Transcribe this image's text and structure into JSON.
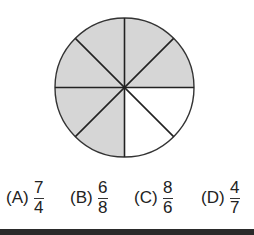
{
  "figure": {
    "type": "circle-fraction",
    "total_slices": 8,
    "shaded_slices": 6,
    "shaded_color": "#d6d6d6",
    "unshaded_color": "#ffffff",
    "line_color": "#333333"
  },
  "options": [
    {
      "label": "(A)",
      "numerator": "7",
      "denominator": "4"
    },
    {
      "label": "(B)",
      "numerator": "6",
      "denominator": "8"
    },
    {
      "label": "(C)",
      "numerator": "8",
      "denominator": "6"
    },
    {
      "label": "(D)",
      "numerator": "4",
      "denominator": "7"
    }
  ]
}
